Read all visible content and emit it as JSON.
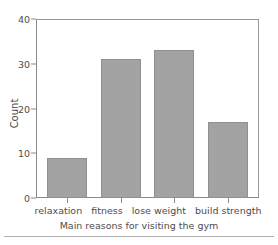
{
  "chart_data": {
    "type": "bar",
    "title": "",
    "categories": [
      "relaxation",
      "fitness",
      "lose weight",
      "build strength"
    ],
    "values": [
      9,
      31,
      33,
      17
    ],
    "xlabel": "Main reasons for visiting the gym",
    "ylabel": "Count",
    "ylim": [
      0,
      40
    ],
    "yticks": [
      0,
      10,
      20,
      30,
      40
    ],
    "ytick_labels": [
      "0",
      "10",
      "20",
      "30",
      "40"
    ],
    "grid": false,
    "legend": "none",
    "bar_fill_color": "#a3a3a3",
    "bar_edge_color": "#8f8f8f",
    "axis_color": "#8a8a8a",
    "text_color": "#4d4d4d",
    "background_color": "#ffffff"
  },
  "figure": {
    "bottom_rule": ""
  }
}
